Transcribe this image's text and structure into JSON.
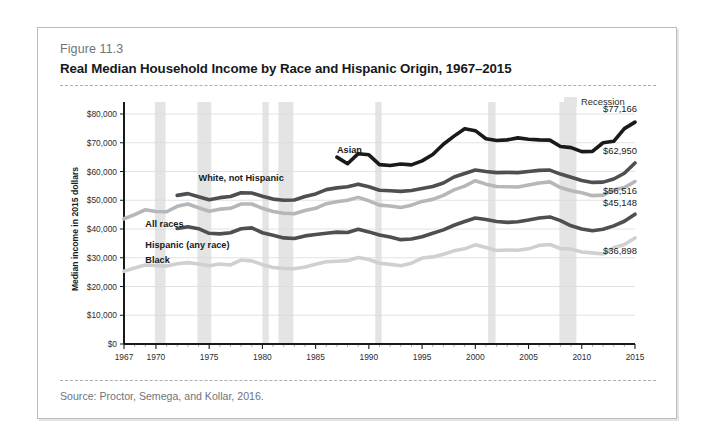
{
  "figure": {
    "number": "Figure 11.3",
    "title": "Real Median Household Income by Race and Hispanic Origin, 1967–2015",
    "source": "Source: Proctor, Semega, and Kollar, 2016."
  },
  "legend": {
    "recession_label": "Recession",
    "recession_color": "#e4e4e4"
  },
  "chart_data": {
    "type": "line",
    "title": "Real Median Household Income by Race and Hispanic Origin, 1967–2015",
    "xlabel": "",
    "ylabel": "Median income in 2015 dollars",
    "xlim": [
      1967,
      2015
    ],
    "ylim": [
      0,
      80000
    ],
    "grid": true,
    "legend_position": "inline-labels",
    "xticks": [
      1967,
      1970,
      1975,
      1980,
      1985,
      1990,
      1995,
      2000,
      2005,
      2010,
      2015
    ],
    "yticks": [
      0,
      10000,
      20000,
      30000,
      40000,
      50000,
      60000,
      70000,
      80000
    ],
    "ytick_labels": [
      "$0",
      "$10,000",
      "$20,000",
      "$30,000",
      "$40,000",
      "$50,000",
      "$60,000",
      "$70,000",
      "$80,000"
    ],
    "recessions": [
      {
        "start": 1969.9,
        "end": 1970.9
      },
      {
        "start": 1973.9,
        "end": 1975.2
      },
      {
        "start": 1980.0,
        "end": 1980.6
      },
      {
        "start": 1981.5,
        "end": 1982.9
      },
      {
        "start": 1990.6,
        "end": 1991.2
      },
      {
        "start": 2001.2,
        "end": 2001.9
      },
      {
        "start": 2007.9,
        "end": 2009.5
      }
    ],
    "series": [
      {
        "name": "Asian",
        "label": "Asian",
        "color": "#1a1a1a",
        "end_value": 77166,
        "end_label": "$77,166",
        "label_x": 1987,
        "label_y": 66500,
        "x": [
          1987,
          1988,
          1989,
          1990,
          1991,
          1992,
          1993,
          1994,
          1995,
          1996,
          1997,
          1998,
          1999,
          2000,
          2001,
          2002,
          2003,
          2004,
          2005,
          2006,
          2007,
          2008,
          2009,
          2010,
          2011,
          2012,
          2013,
          2014,
          2015
        ],
        "values": [
          65000,
          62700,
          66200,
          65800,
          62400,
          62100,
          62600,
          62300,
          63700,
          65900,
          69500,
          72300,
          74900,
          74200,
          71400,
          70800,
          71000,
          71700,
          71200,
          71000,
          70900,
          68700,
          68300,
          66900,
          67000,
          70000,
          70500,
          74900,
          77166
        ]
      },
      {
        "name": "White, not Hispanic",
        "label": "White, not Hispanic",
        "color": "#4d4f52",
        "end_value": 62950,
        "end_label": "$62,950",
        "label_x": 1974,
        "label_y": 56600,
        "x": [
          1972,
          1973,
          1974,
          1975,
          1976,
          1977,
          1978,
          1979,
          1980,
          1981,
          1982,
          1983,
          1984,
          1985,
          1986,
          1987,
          1988,
          1989,
          1990,
          1991,
          1992,
          1993,
          1994,
          1995,
          1996,
          1997,
          1998,
          1999,
          2000,
          2001,
          2002,
          2003,
          2004,
          2005,
          2006,
          2007,
          2008,
          2009,
          2010,
          2011,
          2012,
          2013,
          2014,
          2015
        ],
        "values": [
          51700,
          52300,
          51200,
          50200,
          50900,
          51300,
          52600,
          52500,
          51400,
          50400,
          50000,
          50100,
          51300,
          52200,
          53700,
          54300,
          54700,
          55600,
          54700,
          53500,
          53300,
          53100,
          53400,
          54100,
          54800,
          56000,
          58100,
          59300,
          60500,
          60000,
          59600,
          59700,
          59600,
          60000,
          60400,
          60500,
          59100,
          58000,
          56900,
          56200,
          56300,
          57400,
          59400,
          62950
        ]
      },
      {
        "name": "All races",
        "label": "All races",
        "color": "#b5b7b9",
        "end_value": 56516,
        "end_label": "$56,516",
        "label_x": 1969,
        "label_y": 40800,
        "x": [
          1967,
          1968,
          1969,
          1970,
          1971,
          1972,
          1973,
          1974,
          1975,
          1976,
          1977,
          1978,
          1979,
          1980,
          1981,
          1982,
          1983,
          1984,
          1985,
          1986,
          1987,
          1988,
          1989,
          1990,
          1991,
          1992,
          1993,
          1994,
          1995,
          1996,
          1997,
          1998,
          1999,
          2000,
          2001,
          2002,
          2003,
          2004,
          2005,
          2006,
          2007,
          2008,
          2009,
          2010,
          2011,
          2012,
          2013,
          2014,
          2015
        ],
        "values": [
          43558,
          45000,
          46700,
          46100,
          46000,
          47900,
          48700,
          47400,
          46200,
          46900,
          47200,
          48700,
          48700,
          47200,
          46100,
          45500,
          45300,
          46400,
          47200,
          48800,
          49500,
          50000,
          51000,
          49800,
          48300,
          48000,
          47500,
          48300,
          49600,
          50300,
          51700,
          53600,
          54900,
          56800,
          55600,
          54800,
          54700,
          54600,
          55300,
          56000,
          56400,
          54400,
          53300,
          52600,
          51600,
          51800,
          53600,
          54400,
          56516
        ]
      },
      {
        "name": "Hispanic (any race)",
        "label": "Hispanic (any race)",
        "color": "#4d4f52",
        "end_value": 45148,
        "end_label": "$45,148",
        "label_x": 1969,
        "label_y": 33500,
        "x": [
          1972,
          1973,
          1974,
          1975,
          1976,
          1977,
          1978,
          1979,
          1980,
          1981,
          1982,
          1983,
          1984,
          1985,
          1986,
          1987,
          1988,
          1989,
          1990,
          1991,
          1992,
          1993,
          1994,
          1995,
          1996,
          1997,
          1998,
          1999,
          2000,
          2001,
          2002,
          2003,
          2004,
          2005,
          2006,
          2007,
          2008,
          2009,
          2010,
          2011,
          2012,
          2013,
          2014,
          2015
        ],
        "values": [
          40200,
          40800,
          40100,
          38500,
          38300,
          38700,
          40100,
          40400,
          38700,
          37800,
          36900,
          36700,
          37600,
          38100,
          38500,
          38900,
          38800,
          39900,
          39000,
          37900,
          37200,
          36300,
          36500,
          37300,
          38500,
          39700,
          41300,
          42600,
          43800,
          43300,
          42600,
          42300,
          42500,
          43100,
          43800,
          44200,
          42900,
          41100,
          40000,
          39400,
          39900,
          41100,
          42700,
          45148
        ]
      },
      {
        "name": "Black",
        "label": "Black",
        "color": "#cfd0d1",
        "end_value": 36898,
        "end_label": "$36,898",
        "label_x": 1969,
        "label_y": 28200,
        "x": [
          1967,
          1968,
          1969,
          1970,
          1971,
          1972,
          1973,
          1974,
          1975,
          1976,
          1977,
          1978,
          1979,
          1980,
          1981,
          1982,
          1983,
          1984,
          1985,
          1986,
          1987,
          1988,
          1989,
          1990,
          1991,
          1992,
          1993,
          1994,
          1995,
          1996,
          1997,
          1998,
          1999,
          2000,
          2001,
          2002,
          2003,
          2004,
          2005,
          2006,
          2007,
          2008,
          2009,
          2010,
          2011,
          2012,
          2013,
          2014,
          2015
        ],
        "values": [
          25300,
          26400,
          27500,
          27300,
          27100,
          27900,
          28300,
          27800,
          27200,
          27800,
          27500,
          29200,
          28900,
          27600,
          26600,
          26300,
          26200,
          26800,
          27700,
          28600,
          28800,
          29000,
          30100,
          29400,
          28100,
          27700,
          27200,
          28100,
          29900,
          30300,
          31200,
          32400,
          33100,
          34500,
          33600,
          32500,
          32700,
          32600,
          33100,
          34300,
          34600,
          33200,
          33000,
          32000,
          31700,
          31300,
          33500,
          34600,
          36898
        ]
      }
    ]
  }
}
